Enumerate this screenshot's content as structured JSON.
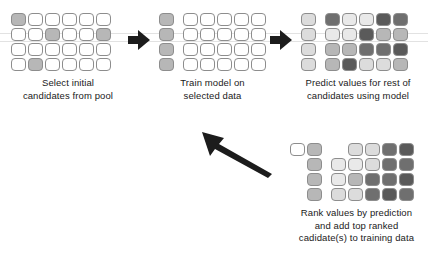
{
  "diagram": {
    "palette": {
      "white": "#ffffff",
      "light": "#e9e9e9",
      "light2": "#dcdcdc",
      "mid": "#b7b7b7",
      "mid2": "#a6a6a6",
      "dark": "#8a8a8a",
      "darker": "#6f6f6f",
      "darkest": "#5a5a5a",
      "stroke": "#8d8d8d",
      "arrow": "#1c1c1c",
      "text": "#1a1a1a",
      "background": "#ffffff"
    },
    "stages": [
      {
        "id": "select-initial-candidates",
        "caption_lines": [
          "Select initial",
          "candidates from pool"
        ],
        "layout": "grid",
        "cols": 6,
        "rows": 4,
        "cells": [
          [
            "mid",
            "white",
            "white",
            "white",
            "white",
            "white"
          ],
          [
            "white",
            "white",
            "mid",
            "white",
            "white",
            "mid"
          ],
          [
            "white",
            "white",
            "white",
            "white",
            "white",
            "white"
          ],
          [
            "white",
            "mid",
            "white",
            "white",
            "white",
            "white"
          ]
        ]
      },
      {
        "id": "train-model-on-selected-data",
        "caption_lines": [
          "Train model on",
          "selected data"
        ],
        "layout": "split",
        "selected_cols": 1,
        "pool_cols": 5,
        "rows": 4,
        "selected_cells": [
          [
            "mid"
          ],
          [
            "mid"
          ],
          [
            "mid"
          ],
          [
            "mid"
          ]
        ],
        "pool_cells": [
          [
            "white",
            "white",
            "white",
            "white",
            "white"
          ],
          [
            "white",
            "white",
            "white",
            "white",
            "white"
          ],
          [
            "white",
            "white",
            "white",
            "white",
            "white"
          ],
          [
            "white",
            "white",
            "white",
            "white",
            "white"
          ]
        ]
      },
      {
        "id": "predict-values-for-rest",
        "caption_lines": [
          "Predict values for rest of",
          "candidates using model"
        ],
        "layout": "split",
        "selected_cols": 1,
        "pool_cols": 5,
        "rows": 4,
        "selected_cells": [
          [
            "light2"
          ],
          [
            "light2"
          ],
          [
            "light2"
          ],
          [
            "light2"
          ]
        ],
        "pool_cells": [
          [
            "darker",
            "light",
            "light",
            "darkest",
            "darker"
          ],
          [
            "light",
            "light",
            "darkest",
            "mid",
            "mid"
          ],
          [
            "mid",
            "mid",
            "darker",
            "darker",
            "darkest"
          ],
          [
            "mid",
            "darkest",
            "light2",
            "light2",
            "mid"
          ]
        ]
      },
      {
        "id": "rank-values-and-add-top-ranked",
        "caption_lines": [
          "Rank values by prediction",
          "and add top ranked",
          "cadidate(s) to training data"
        ],
        "layout": "ranked",
        "selected_cols": 2,
        "pool_cols": 4,
        "rows": 4,
        "selected_cells": [
          [
            "white",
            "mid"
          ],
          [
            "blank",
            "mid"
          ],
          [
            "blank",
            "mid"
          ],
          [
            "blank",
            "mid"
          ]
        ],
        "pool_cells": [
          [
            "blank",
            "light2",
            "light2",
            "darker",
            "darkest"
          ],
          [
            "light",
            "light",
            "light2",
            "darker",
            "darker"
          ],
          [
            "light",
            "mid",
            "darker",
            "darker",
            "darkest"
          ],
          [
            "light2",
            "light2",
            "darker",
            "darkest",
            "darker"
          ]
        ]
      }
    ],
    "arrows": [
      {
        "id": "arrow-stage1-to-stage2",
        "direction": "right"
      },
      {
        "id": "arrow-stage2-to-stage3",
        "direction": "right"
      },
      {
        "id": "arrow-stage4-to-stage2",
        "direction": "up-left"
      }
    ]
  }
}
